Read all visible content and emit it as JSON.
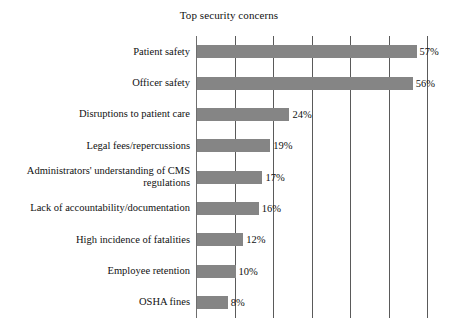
{
  "chart_data": {
    "type": "bar",
    "orientation": "horizontal",
    "title": "Top security concerns",
    "xlabel": "",
    "ylabel": "",
    "categories": [
      "Patient safety",
      "Officer safety",
      "Disruptions to patient care",
      "Legal fees/repercussions",
      "Administrators' understanding of CMS regulations",
      "Lack of accountability/documentation",
      "High incidence of fatalities",
      "Employee retention",
      "OSHA fines"
    ],
    "values": [
      57,
      56,
      24,
      19,
      17,
      16,
      12,
      10,
      8
    ],
    "value_labels": [
      "57%",
      "56%",
      "24%",
      "19%",
      "17%",
      "16%",
      "12%",
      "10%",
      "8%"
    ],
    "xlim": [
      0,
      61
    ],
    "gridlines": [
      0,
      10,
      20,
      30,
      40,
      50,
      60
    ],
    "grid": true,
    "tick_labels_visible": false,
    "legend": null,
    "bar_color": "#858585",
    "grid_color": "#5a5a5a",
    "text_color": "#111111",
    "background_color": "#ffffff"
  }
}
